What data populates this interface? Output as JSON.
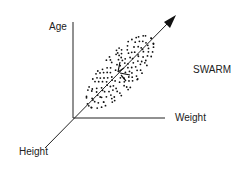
{
  "diagram": {
    "type": "3d-axes-scatter-schematic",
    "axes": {
      "vertical": "Age",
      "horizontal": "Weight",
      "diagonal": "Height"
    },
    "title_label": "SWARM",
    "colors": {
      "ink": "#111111",
      "background": "#ffffff"
    }
  }
}
